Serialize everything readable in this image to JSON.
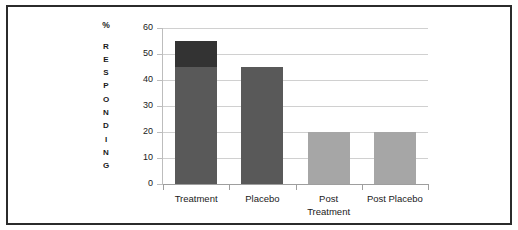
{
  "figure": {
    "border_color": "#2b2b2b",
    "background": "#ffffff"
  },
  "chart_data": {
    "type": "bar",
    "title": "",
    "subtitle": "",
    "xlabel": "",
    "ylabel": "% RESPONDING",
    "ylabel_top": "%",
    "ylabel_stacked": "RESPONDING",
    "categories": [
      "Treatment",
      "Placebo",
      "Post Treatment",
      "Post Placebo"
    ],
    "category_label_lines": [
      [
        "Treatment"
      ],
      [
        "Placebo"
      ],
      [
        "Post",
        "Treatment"
      ],
      [
        "Post Placebo"
      ]
    ],
    "series": [
      {
        "name": "Responding (base)",
        "color": "#595959",
        "values": [
          45,
          45,
          20,
          20
        ]
      },
      {
        "name": "Responding (additional)",
        "color": "#333333",
        "values": [
          10,
          0,
          0,
          0
        ]
      }
    ],
    "totals": [
      55,
      45,
      20,
      20
    ],
    "bar_colors": [
      "#595959",
      "#595959",
      "#a6a6a6",
      "#a6a6a6"
    ],
    "ylim": [
      0,
      60
    ],
    "yticks": [
      0,
      10,
      20,
      30,
      40,
      50,
      60
    ],
    "ytick_labels": [
      "0",
      "10",
      "20",
      "30",
      "40",
      "50",
      "60"
    ],
    "grid": true,
    "grid_color": "#d0d0d0",
    "legend": false,
    "legend_position": "none",
    "annotations": []
  }
}
